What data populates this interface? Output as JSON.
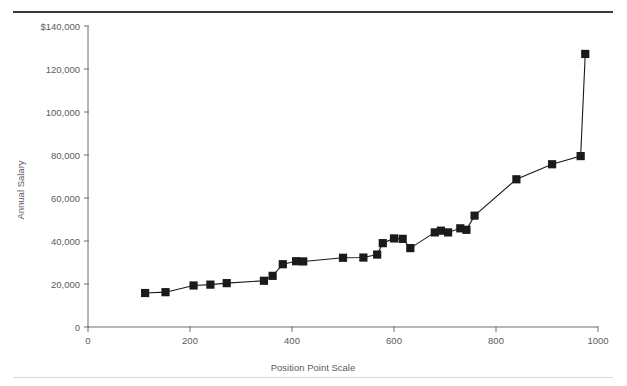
{
  "figure": {
    "rules": {
      "top_rule_color": "#3a3a3a",
      "bottom_rule_color": "#d8d8d8"
    },
    "ink_color": "#1a1a1a",
    "axis_color": "#6e6e6e",
    "label_color": "#5b5b5b"
  },
  "chart_data": {
    "type": "line",
    "title": "",
    "subtitle": "",
    "xlabel": "Position Point Scale",
    "ylabel": "Annual Salary",
    "xlim": [
      0,
      1000
    ],
    "ylim": [
      0,
      140000
    ],
    "grid": false,
    "legend": null,
    "marker": "square",
    "x_ticks": [
      0,
      200,
      400,
      600,
      800,
      1000
    ],
    "x_tick_labels": [
      "0",
      "200",
      "400",
      "600",
      "800",
      "1000"
    ],
    "y_ticks": [
      0,
      20000,
      40000,
      60000,
      80000,
      100000,
      120000,
      140000
    ],
    "y_tick_labels": [
      "0",
      "20,000",
      "40,000",
      "60,000",
      "80,000",
      "100,000",
      "120,000",
      "$140,000"
    ],
    "series": [
      {
        "name": "Salary structure",
        "x": [
          112,
          152,
          207,
          240,
          272,
          345,
          362,
          382,
          408,
          422,
          500,
          540,
          567,
          578,
          600,
          617,
          632,
          680,
          692,
          706,
          730,
          742,
          758,
          840,
          910,
          966,
          975
        ],
        "y": [
          15800,
          16200,
          19300,
          19700,
          20400,
          21500,
          23800,
          29200,
          30600,
          30500,
          32200,
          32300,
          33700,
          39000,
          41200,
          41000,
          36700,
          44000,
          44800,
          44000,
          45900,
          45200,
          51800,
          68700,
          75700,
          79500,
          127000
        ]
      }
    ]
  }
}
